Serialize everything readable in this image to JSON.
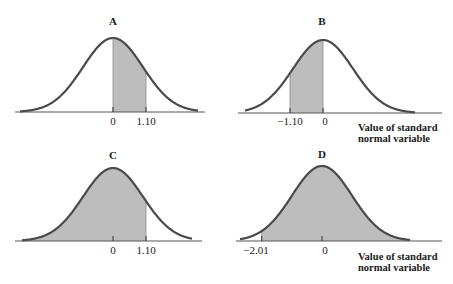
{
  "colors": {
    "curve": "#4a4a4a",
    "shade": "#bdbdbd",
    "axis": "#555555",
    "text": "#1a1a1a",
    "background": "#ffffff"
  },
  "axis_label": {
    "line1": "Value of standard",
    "line2": "normal variable"
  },
  "panels": [
    {
      "title": "A",
      "ticks": [
        {
          "value": 0,
          "label": "0"
        },
        {
          "value": 1.1,
          "label": "1.10"
        }
      ],
      "shade_from": 0,
      "shade_to": 1.1
    },
    {
      "title": "B",
      "ticks": [
        {
          "value": -1.1,
          "label": "−1.10"
        },
        {
          "value": 0,
          "label": "0"
        }
      ],
      "shade_from": -1.1,
      "shade_to": 0
    },
    {
      "title": "C",
      "ticks": [
        {
          "value": 0,
          "label": "0"
        },
        {
          "value": 1.1,
          "label": "1.10"
        }
      ],
      "shade_from": -3,
      "shade_to": 1.1
    },
    {
      "title": "D",
      "ticks": [
        {
          "value": -2.01,
          "label": "−2.01"
        },
        {
          "value": 0,
          "label": "0"
        }
      ],
      "shade_from": -2.01,
      "shade_to": 3
    }
  ],
  "chart_data": [
    {
      "type": "area",
      "title": "A",
      "distribution": "standard normal",
      "x_ticks": [
        0,
        1.1
      ],
      "tick_labels": [
        "0",
        "1.10"
      ],
      "shaded_region": [
        0,
        1.1
      ],
      "xlabel": "",
      "xlim": [
        -3,
        3
      ],
      "grid": false
    },
    {
      "type": "area",
      "title": "B",
      "distribution": "standard normal",
      "x_ticks": [
        -1.1,
        0
      ],
      "tick_labels": [
        "−1.10",
        "0"
      ],
      "shaded_region": [
        -1.1,
        0
      ],
      "xlabel": "Value of standard normal variable",
      "xlim": [
        -3,
        3
      ],
      "grid": false
    },
    {
      "type": "area",
      "title": "C",
      "distribution": "standard normal",
      "x_ticks": [
        0,
        1.1
      ],
      "tick_labels": [
        "0",
        "1.10"
      ],
      "shaded_region": [
        "-inf",
        1.1
      ],
      "xlabel": "",
      "xlim": [
        -3,
        3
      ],
      "grid": false
    },
    {
      "type": "area",
      "title": "D",
      "distribution": "standard normal",
      "x_ticks": [
        -2.01,
        0
      ],
      "tick_labels": [
        "−2.01",
        "0"
      ],
      "shaded_region": [
        -2.01,
        "inf"
      ],
      "xlabel": "Value of standard normal variable",
      "xlim": [
        -3,
        3
      ],
      "grid": false
    }
  ]
}
